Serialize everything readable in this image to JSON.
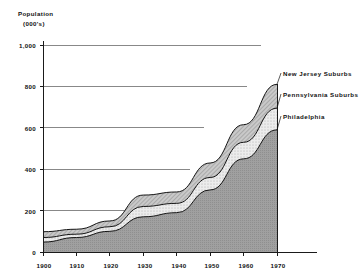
{
  "chart_data": {
    "type": "area",
    "stacked": true,
    "title": "",
    "ylabel_line1": "Population",
    "ylabel_line2": "(000's)",
    "xlabel": "",
    "x": [
      1900,
      1910,
      1920,
      1930,
      1940,
      1950,
      1960,
      1970
    ],
    "categories": [
      "1900",
      "1910",
      "1920",
      "1930",
      "1940",
      "1950",
      "1960",
      "1970"
    ],
    "xlim": [
      1900,
      1970
    ],
    "ylim": [
      0,
      1000
    ],
    "yticks": [
      0,
      200,
      400,
      600,
      800,
      1000
    ],
    "ytick_labels": [
      "0",
      "200",
      "400",
      "600",
      "800",
      "1,000"
    ],
    "xticks": [
      1900,
      1910,
      1920,
      1930,
      1940,
      1950,
      1960,
      1970
    ],
    "xtick_labels": [
      "1900",
      "1910",
      "1920",
      "1930",
      "1940",
      "1950",
      "1960",
      "1970"
    ],
    "grid": true,
    "grid_axis": "y",
    "legend_position": "right-inline",
    "series": [
      {
        "name": "Philadelphia",
        "color": "#9a9a9a",
        "values": [
          48,
          70,
          100,
          170,
          190,
          300,
          450,
          590
        ]
      },
      {
        "name": "Pennsylvania Suburbs",
        "color": "#d8d8d8",
        "values": [
          22,
          16,
          22,
          50,
          45,
          60,
          80,
          105
        ]
      },
      {
        "name": "New Jersey Suburbs",
        "color": "#b8b8b8",
        "values": [
          28,
          24,
          28,
          55,
          55,
          70,
          85,
          115
        ]
      }
    ],
    "cumulative": {
      "philadelphia": [
        48,
        70,
        100,
        170,
        190,
        300,
        450,
        590
      ],
      "plus_pennsylvania": [
        70,
        86,
        122,
        220,
        235,
        360,
        530,
        695
      ],
      "total": [
        98,
        110,
        150,
        275,
        290,
        430,
        615,
        810
      ]
    },
    "annotations": [
      {
        "text": "New Jersey Suburbs",
        "target_year": 1970,
        "target_value": 810
      },
      {
        "text": "Pennsylvania Suburbs",
        "target_year": 1970,
        "target_value": 695
      },
      {
        "text": "Philadelphia",
        "target_year": 1970,
        "target_value": 590
      }
    ]
  },
  "legend": {
    "items": [
      {
        "label": "New Jersey Suburbs"
      },
      {
        "label": "Pennsylvania Suburbs"
      },
      {
        "label": "Philadelphia"
      }
    ]
  },
  "axes": {
    "y_title_line1": "Population",
    "y_title_line2": "(000's)",
    "y_labels": [
      "1,000",
      "800",
      "600",
      "400",
      "200",
      "0"
    ],
    "x_labels": [
      "1900",
      "1910",
      "1920",
      "1930",
      "1940",
      "1950",
      "1960",
      "1970"
    ]
  },
  "colors": {
    "philadelphia": "#9a9a9a",
    "pennsylvania": "#dcdcdc",
    "newjersey": "#b5b5b5",
    "axis": "#1a1a1a",
    "grid": "#555555"
  }
}
